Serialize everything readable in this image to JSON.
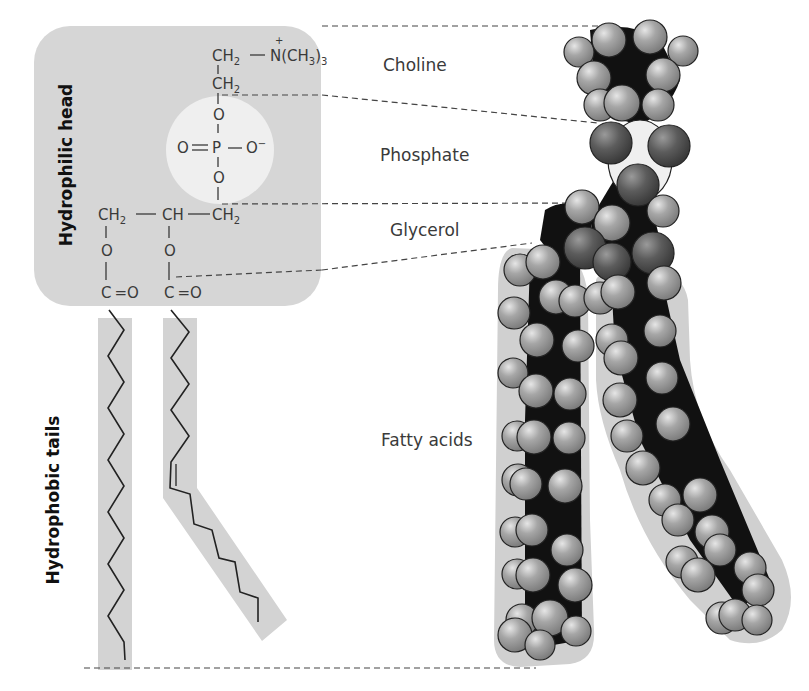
{
  "figure": {
    "type": "phospholipid structure diagram",
    "side_labels": {
      "head": "Hydrophilic head",
      "tails": "Hydrophobic tails"
    },
    "region_labels": {
      "choline": "Choline",
      "phosphate": "Phosphate",
      "glycerol": "Glycerol",
      "fatty_acids": "Fatty acids"
    },
    "structural_formula": {
      "choline_top": "CH2 — N+(CH3)3",
      "choline_ch2": "CH2",
      "phosphate": "O=P—O−",
      "glycerol": "CH2 — CH — CH2",
      "ester_left": "C=O",
      "ester_right": "C=O",
      "atoms": {
        "ch2": "CH",
        "sub2": "2",
        "n": "N",
        "plus": "+",
        "nme3_a": "(CH",
        "nme3_b": "3",
        "nme3_c": ")",
        "nme3_d": "3",
        "o": "O",
        "p": "P",
        "o_minus": "O",
        "minus": "−",
        "ch": "CH",
        "c": "C",
        "eq_o": "=O",
        "dash_bond": "—"
      }
    },
    "colors": {
      "head_box": "#d6d6d6",
      "phosphate_circle": "#efefef",
      "tail_band": "#d3d3d3",
      "atom_hydrogen": "#9a9a9a",
      "atom_oxygen": "#5e5e5e",
      "atom_carbon": "#111111"
    }
  }
}
